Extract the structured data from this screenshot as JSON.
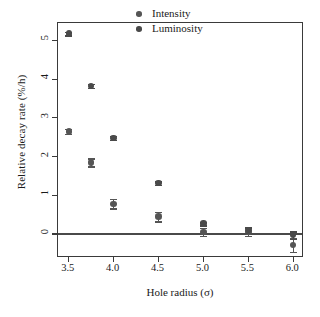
{
  "chart_data": {
    "type": "scatter",
    "title": "",
    "xlabel": "Hole radius (σ)",
    "ylabel": "Relative decay rate (%/h)",
    "xlim": [
      3.38,
      6.12
    ],
    "ylim": [
      -0.62,
      5.45
    ],
    "grid": false,
    "legend_position": "top-right-inside",
    "reference_lines": [
      {
        "axis": "y",
        "value": 0,
        "color": "#4a4a4a"
      }
    ],
    "xticks": [
      3.5,
      4.0,
      4.5,
      5.0,
      5.5,
      6.0
    ],
    "xticklabels": [
      "3.5",
      "4.0",
      "4.5",
      "5.0",
      "5.5",
      "6.0"
    ],
    "yticks": [
      0,
      1,
      2,
      3,
      4,
      5
    ],
    "yticklabels": [
      "0",
      "1",
      "2",
      "3",
      "4",
      "5"
    ],
    "series": [
      {
        "name": "Intensity",
        "color": "#555555",
        "marker": "circle",
        "x": [
          3.5,
          3.75,
          4.0,
          4.5,
          5.0,
          5.5,
          6.0
        ],
        "values": [
          2.65,
          1.85,
          0.78,
          0.45,
          0.05,
          0.05,
          -0.28
        ],
        "yerr": [
          0.07,
          0.1,
          0.12,
          0.12,
          0.1,
          0.1,
          0.18
        ]
      },
      {
        "name": "Luminosity",
        "color": "#4a4a4a",
        "marker": "circle",
        "x": [
          3.5,
          3.75,
          4.0,
          4.5,
          5.0,
          5.5,
          6.0
        ],
        "values": [
          5.18,
          3.82,
          2.48,
          1.31,
          0.27,
          0.1,
          -0.03
        ],
        "yerr": [
          0.05,
          0.05,
          0.05,
          0.05,
          0.05,
          0.07,
          0.1
        ]
      }
    ]
  },
  "legend": {
    "items": [
      {
        "label": "Intensity",
        "color": "#555555"
      },
      {
        "label": "Luminosity",
        "color": "#4a4a4a"
      }
    ]
  }
}
